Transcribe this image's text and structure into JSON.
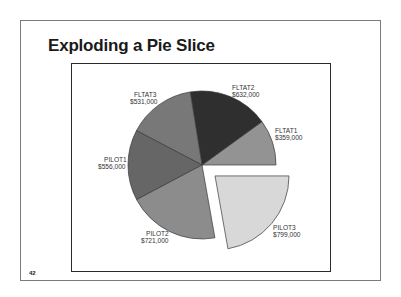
{
  "slide": {
    "title": "Exploding a Pie Slice",
    "page_number": "42"
  },
  "chart_data": {
    "type": "pie",
    "title": "",
    "total": 3598,
    "start_angle_deg": 0,
    "direction": "counterclockwise",
    "exploded": "PILOT3",
    "slices": [
      {
        "name": "FLTAT1",
        "value": 359000,
        "label": "$359,000",
        "color": "#939393"
      },
      {
        "name": "FLTAT2",
        "value": 632000,
        "label": "$632,000",
        "color": "#2f2f2f"
      },
      {
        "name": "FLTAT3",
        "value": 531000,
        "label": "$531,000",
        "color": "#787878"
      },
      {
        "name": "PILOT1",
        "value": 556000,
        "label": "$556,000",
        "color": "#666666"
      },
      {
        "name": "PILOT2",
        "value": 721000,
        "label": "$721,000",
        "color": "#8c8c8c"
      },
      {
        "name": "PILOT3",
        "value": 799000,
        "label": "$799,000",
        "color": "#d8d8d8"
      }
    ],
    "legend": "none (labels adjacent to slices)"
  },
  "labels": {
    "fltat1": {
      "name": "FLTAT1",
      "value": "$359,000"
    },
    "fltat2": {
      "name": "FLTAT2",
      "value": "$632,000"
    },
    "fltat3": {
      "name": "FLTAT3",
      "value": "$531,000"
    },
    "pilot1": {
      "name": "PILOT1",
      "value": "$556,000"
    },
    "pilot2": {
      "name": "PILOT2",
      "value": "$721,000"
    },
    "pilot3": {
      "name": "PILOT3",
      "value": "$799,000"
    }
  }
}
